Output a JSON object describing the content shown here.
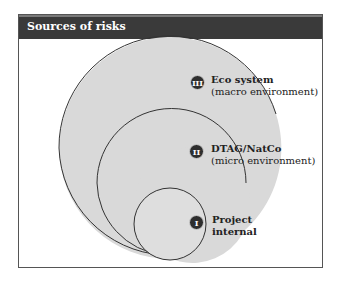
{
  "header": {
    "title": "Sources of risks"
  },
  "colors": {
    "header_bg": "#3a3a3a",
    "fill": "#d9d9d9",
    "stroke": "#333333",
    "badge": "#2e2e2e"
  },
  "levels": [
    {
      "numeral": "III",
      "title": "Eco system",
      "subtitle": "(macro environment)"
    },
    {
      "numeral": "II",
      "title": "DTAG/NatCo",
      "subtitle": "(micro environment)"
    },
    {
      "numeral": "I",
      "title": "Project",
      "subtitle": "internal"
    }
  ]
}
